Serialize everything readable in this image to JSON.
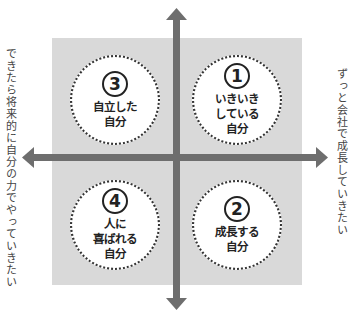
{
  "diagram": {
    "top_label": "",
    "left_label": "できたら将来的に自分の力でやっていきたい",
    "right_label": "ずっと会社で成長していきたい",
    "colors": {
      "quadrant_bg": "#d9d9d9",
      "arrow": "#6e6e6e",
      "circle_border": "#333333",
      "text": "#222222"
    },
    "quadrants": [
      {
        "position": "top-right",
        "number": "1",
        "label": "いきいき\nしている\n自分"
      },
      {
        "position": "bottom-right",
        "number": "2",
        "label": "成長する\n自分"
      },
      {
        "position": "top-left",
        "number": "3",
        "label": "自立した\n自分"
      },
      {
        "position": "bottom-left",
        "number": "4",
        "label": "人に\n喜ばれる\n自分"
      }
    ]
  }
}
